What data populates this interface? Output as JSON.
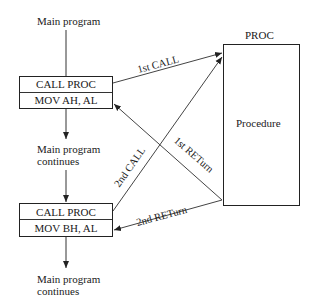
{
  "diagram": {
    "main_label_top": "Main program",
    "continues_1": [
      "Main program",
      "continues"
    ],
    "continues_2": [
      "Main program",
      "continues"
    ],
    "box1": {
      "line1": "CALL PROC",
      "line2": "MOV AH, AL"
    },
    "box2": {
      "line1": "CALL PROC",
      "line2": "MOV BH, AL"
    },
    "proc_title": "PROC",
    "proc_body": "Procedure",
    "edges": {
      "call1": "1st CALL",
      "ret1": "1st RETurn",
      "call2": "2nd CALL",
      "ret2": "2nd RETurn"
    }
  }
}
